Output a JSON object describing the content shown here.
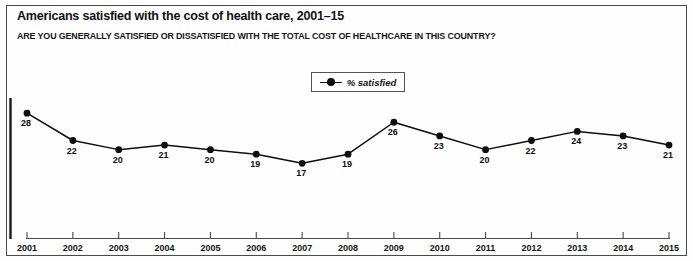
{
  "chart_data": {
    "type": "line",
    "title": "Americans satisfied with the cost of health care, 2001–15",
    "subtitle": "ARE YOU GENERALLY SATISFIED OR DISSATISFIED WITH THE TOTAL COST OF HEALTHCARE IN THIS COUNTRY?",
    "xlabel": "",
    "ylabel": "",
    "categories": [
      "2001",
      "2002",
      "2003",
      "2004",
      "2005",
      "2006",
      "2007",
      "2008",
      "2009",
      "2010",
      "2011",
      "2012",
      "2013",
      "2014",
      "2015"
    ],
    "values": [
      28,
      22,
      20,
      21,
      20,
      19,
      17,
      19,
      26,
      23,
      20,
      22,
      24,
      23,
      21
    ],
    "series": [
      {
        "name": "% satisfied",
        "values": [
          28,
          22,
          20,
          21,
          20,
          19,
          17,
          19,
          26,
          23,
          20,
          22,
          24,
          23,
          21
        ]
      }
    ],
    "data_labels": [
      "28",
      "22",
      "20",
      "21",
      "20",
      "19",
      "17",
      "19",
      "26",
      "23",
      "20",
      "22",
      "24",
      "23",
      "21"
    ],
    "ylim": [
      14,
      30
    ],
    "grid": false,
    "legend": {
      "entries": [
        "% satisfied"
      ],
      "position": "top-center"
    },
    "marker": "filled-circle",
    "line_color": "#0d0d0d",
    "marker_color": "#0d0d0d"
  },
  "legend": {
    "label": "% satisfied"
  }
}
